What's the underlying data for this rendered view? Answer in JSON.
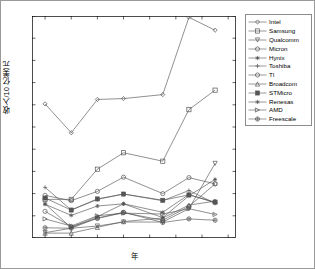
{
  "chart_data": {
    "type": "line",
    "title": "",
    "xlabel": "年",
    "ylabel": "收入/10 亿美元",
    "xlim": [
      1999,
      2014.6
    ],
    "ylim": [
      0,
      50
    ],
    "xticks": [
      2000,
      2002,
      2004,
      2006,
      2008,
      2010,
      2012,
      2014
    ],
    "yticks": [
      0,
      5,
      10,
      15,
      20,
      25,
      30,
      35,
      40,
      45,
      50
    ],
    "grid": false,
    "legend_position": "outside-right-top",
    "x": [
      2000,
      2002,
      2004,
      2006,
      2009,
      2011,
      2013
    ],
    "series": [
      {
        "name": "Intel",
        "marker": "diamond",
        "values": [
          30.2,
          23.7,
          31.2,
          31.4,
          32.3,
          49.7,
          46.8
        ]
      },
      {
        "name": "Samsung",
        "marker": "square",
        "values": [
          8.7,
          8.7,
          15.5,
          19.2,
          17.3,
          28.9,
          33.3
        ]
      },
      {
        "name": "Qualcomm",
        "marker": "triangle-down",
        "values": [
          1.2,
          2.2,
          2.7,
          3.6,
          3.6,
          6.6,
          16.8
        ]
      },
      {
        "name": "Micron",
        "marker": "circle",
        "values": [
          6.0,
          2.6,
          4.4,
          5.7,
          4.0,
          7.1,
          12.2
        ]
      },
      {
        "name": "Hynix",
        "marker": "star-filled",
        "values": [
          7.7,
          2.3,
          4.8,
          7.7,
          4.6,
          9.5,
          13.2
        ]
      },
      {
        "name": "Toshiba",
        "marker": "plus",
        "values": [
          11.4,
          6.3,
          8.7,
          9.9,
          8.4,
          10.7,
          7.8
        ]
      },
      {
        "name": "TI",
        "marker": "circle-open",
        "values": [
          9.6,
          8.4,
          10.5,
          13.7,
          10.0,
          13.6,
          12.2
        ]
      },
      {
        "name": "Broadcom",
        "marker": "triangle-up",
        "values": [
          1.1,
          1.1,
          2.4,
          3.7,
          4.5,
          7.4,
          8.3
        ]
      },
      {
        "name": "STMicro",
        "marker": "square-filled",
        "values": [
          9.0,
          6.3,
          8.8,
          9.9,
          8.5,
          9.7,
          8.1
        ]
      },
      {
        "name": "Renesas",
        "marker": "star",
        "values": [
          7.6,
          5.1,
          7.2,
          7.7,
          5.8,
          9.8,
          7.9
        ]
      },
      {
        "name": "AMD",
        "marker": "triangle-right",
        "values": [
          4.3,
          2.7,
          5.0,
          5.6,
          5.4,
          6.6,
          5.3
        ]
      },
      {
        "name": "Freescale",
        "marker": "circle-plus",
        "values": [
          2.3,
          2.2,
          4.5,
          5.8,
          3.5,
          4.3,
          4.0
        ]
      }
    ]
  },
  "legend": {
    "items": [
      {
        "label": "Intel"
      },
      {
        "label": "Samsung"
      },
      {
        "label": "Qualcomm"
      },
      {
        "label": "Micron"
      },
      {
        "label": "Hynix"
      },
      {
        "label": "Toshiba"
      },
      {
        "label": "TI"
      },
      {
        "label": "Broadcom"
      },
      {
        "label": "STMicro"
      },
      {
        "label": "Renesas"
      },
      {
        "label": "AMD"
      },
      {
        "label": "Freescale"
      }
    ]
  },
  "axis": {
    "x_title": "年",
    "y_title": "收入/10 亿美元"
  },
  "colors": {
    "line": "#555555",
    "axis": "#000000",
    "background": "#ffffff",
    "frame": "#9a9a9a"
  }
}
